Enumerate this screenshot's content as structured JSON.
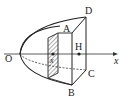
{
  "diagram": {
    "labels": {
      "O": "O",
      "A": "A",
      "B": "B",
      "C": "C",
      "D": "D",
      "H": "H",
      "x_axis": "x",
      "x_slice": "x"
    },
    "colors": {
      "stroke": "#222222",
      "background": "#ffffff"
    }
  }
}
